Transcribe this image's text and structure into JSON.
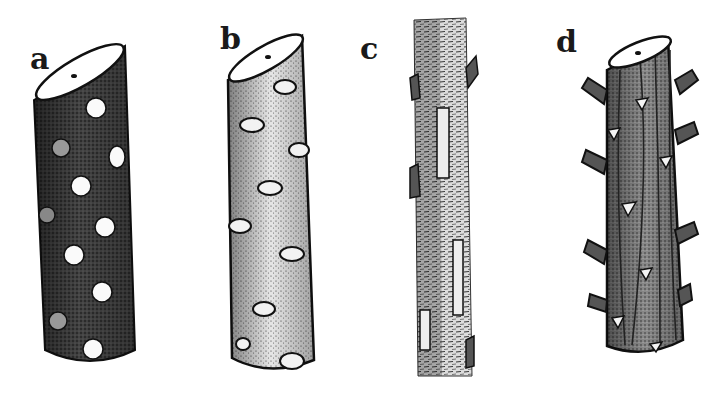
{
  "figure": {
    "panels": [
      {
        "id": "a",
        "label": "a",
        "description": "hairy stem with round white lenticel-like leaf scars",
        "label_pos": [
          30,
          46
        ]
      },
      {
        "id": "b",
        "label": "b",
        "description": "stippled stem with oval bud scars along sides",
        "label_pos": [
          220,
          25
        ]
      },
      {
        "id": "c",
        "label": "c",
        "description": "slender stem covered in dense short hairs with small appressed buds",
        "label_pos": [
          360,
          36
        ]
      },
      {
        "id": "d",
        "label": "d",
        "description": "ridged stem with short spur branches and triangular leaf scars",
        "label_pos": [
          556,
          28
        ]
      }
    ]
  },
  "colors": {
    "background": "#ffffff",
    "ink": "#1a1a1a",
    "paper": "#ffffff",
    "stem_a": "#3a3a3a",
    "stem_b": "#d8d8d8",
    "stem_c": "#bdbdbd",
    "stem_d": "#6a6a6a"
  }
}
